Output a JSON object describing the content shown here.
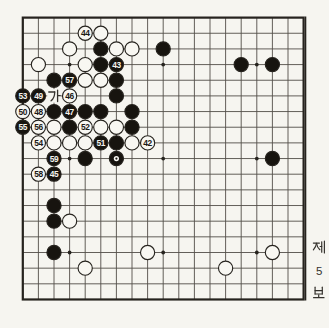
{
  "side_caption": {
    "chars": [
      "제",
      "5",
      "보"
    ],
    "text": "제5보"
  },
  "board": {
    "size": 19,
    "star_points": [
      [
        3,
        3
      ],
      [
        9,
        3
      ],
      [
        15,
        3
      ],
      [
        3,
        9
      ],
      [
        9,
        9
      ],
      [
        15,
        9
      ],
      [
        3,
        15
      ],
      [
        9,
        15
      ],
      [
        15,
        15
      ]
    ],
    "point_labels": [
      {
        "col": 2,
        "row": 5,
        "text": "가"
      }
    ],
    "stones": [
      {
        "col": 4,
        "row": 1,
        "color": "white",
        "label": "44"
      },
      {
        "col": 5,
        "row": 1,
        "color": "white"
      },
      {
        "col": 3,
        "row": 2,
        "color": "white"
      },
      {
        "col": 5,
        "row": 2,
        "color": "black"
      },
      {
        "col": 6,
        "row": 2,
        "color": "white"
      },
      {
        "col": 7,
        "row": 2,
        "color": "white"
      },
      {
        "col": 9,
        "row": 2,
        "color": "black"
      },
      {
        "col": 1,
        "row": 3,
        "color": "white"
      },
      {
        "col": 4,
        "row": 3,
        "color": "white"
      },
      {
        "col": 5,
        "row": 3,
        "color": "black"
      },
      {
        "col": 6,
        "row": 3,
        "color": "black",
        "label": "43"
      },
      {
        "col": 14,
        "row": 3,
        "color": "black"
      },
      {
        "col": 16,
        "row": 3,
        "color": "black"
      },
      {
        "col": 2,
        "row": 4,
        "color": "black"
      },
      {
        "col": 3,
        "row": 4,
        "color": "black",
        "label": "57"
      },
      {
        "col": 4,
        "row": 4,
        "color": "white"
      },
      {
        "col": 5,
        "row": 4,
        "color": "white"
      },
      {
        "col": 6,
        "row": 4,
        "color": "black"
      },
      {
        "col": 0,
        "row": 5,
        "color": "black",
        "label": "53"
      },
      {
        "col": 1,
        "row": 5,
        "color": "black",
        "label": "49"
      },
      {
        "col": 3,
        "row": 5,
        "color": "white",
        "label": "46"
      },
      {
        "col": 6,
        "row": 5,
        "color": "black"
      },
      {
        "col": 0,
        "row": 6,
        "color": "white",
        "label": "50"
      },
      {
        "col": 1,
        "row": 6,
        "color": "white",
        "label": "48"
      },
      {
        "col": 2,
        "row": 6,
        "color": "black"
      },
      {
        "col": 3,
        "row": 6,
        "color": "black",
        "label": "47"
      },
      {
        "col": 4,
        "row": 6,
        "color": "black"
      },
      {
        "col": 5,
        "row": 6,
        "color": "black"
      },
      {
        "col": 7,
        "row": 6,
        "color": "black"
      },
      {
        "col": 0,
        "row": 7,
        "color": "black",
        "label": "55"
      },
      {
        "col": 1,
        "row": 7,
        "color": "white",
        "label": "56"
      },
      {
        "col": 2,
        "row": 7,
        "color": "white"
      },
      {
        "col": 3,
        "row": 7,
        "color": "black"
      },
      {
        "col": 4,
        "row": 7,
        "color": "white",
        "label": "52"
      },
      {
        "col": 5,
        "row": 7,
        "color": "white"
      },
      {
        "col": 6,
        "row": 7,
        "color": "white"
      },
      {
        "col": 7,
        "row": 7,
        "color": "black"
      },
      {
        "col": 1,
        "row": 8,
        "color": "white",
        "label": "54"
      },
      {
        "col": 2,
        "row": 8,
        "color": "white"
      },
      {
        "col": 3,
        "row": 8,
        "color": "white"
      },
      {
        "col": 4,
        "row": 8,
        "color": "white"
      },
      {
        "col": 5,
        "row": 8,
        "color": "black",
        "label": "51"
      },
      {
        "col": 6,
        "row": 8,
        "color": "black"
      },
      {
        "col": 7,
        "row": 8,
        "color": "white"
      },
      {
        "col": 8,
        "row": 8,
        "color": "white",
        "label": "42"
      },
      {
        "col": 2,
        "row": 9,
        "color": "black",
        "label": "59"
      },
      {
        "col": 4,
        "row": 9,
        "color": "black"
      },
      {
        "col": 6,
        "row": 9,
        "color": "black",
        "marker": "dot"
      },
      {
        "col": 16,
        "row": 9,
        "color": "black"
      },
      {
        "col": 1,
        "row": 10,
        "color": "white",
        "label": "58"
      },
      {
        "col": 2,
        "row": 10,
        "color": "black",
        "label": "45"
      },
      {
        "col": 2,
        "row": 12,
        "color": "black"
      },
      {
        "col": 2,
        "row": 13,
        "color": "black"
      },
      {
        "col": 3,
        "row": 13,
        "color": "white"
      },
      {
        "col": 2,
        "row": 15,
        "color": "black"
      },
      {
        "col": 8,
        "row": 15,
        "color": "white"
      },
      {
        "col": 16,
        "row": 15,
        "color": "white"
      },
      {
        "col": 4,
        "row": 16,
        "color": "white"
      },
      {
        "col": 13,
        "row": 16,
        "color": "white"
      }
    ]
  },
  "colors": {
    "paper": "#f6f5f0",
    "grid_line": "#45413b",
    "border": "#26231e",
    "black_stone": "#17140f",
    "white_stone_fill": "#f8f7f2",
    "stone_outline": "#26231e",
    "caption_text": "#35322d"
  }
}
